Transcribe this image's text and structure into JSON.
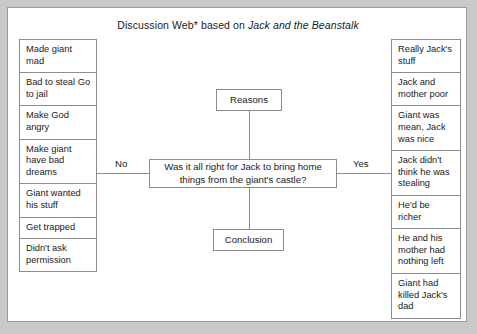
{
  "title": {
    "prefix": "Discussion Web* based on ",
    "book": "Jack and the Beanstalk"
  },
  "center": {
    "reasons_label": "Reasons",
    "question": "Was it all right for Jack to bring home things from the giant's castle?",
    "conclusion_label": "Conclusion"
  },
  "branches": {
    "no_label": "No",
    "yes_label": "Yes"
  },
  "no_reasons": [
    "Made giant mad",
    "Bad to steal Go to jail",
    "Make God angry",
    "Make giant have bad dreams",
    "Giant wanted his stuff",
    "Get trapped",
    "Didn't ask permission"
  ],
  "yes_reasons": [
    "Really Jack's stuff",
    "Jack and mother poor",
    "Giant was mean, Jack was nice",
    "Jack didn't think he was stealing",
    "He'd be richer",
    "He and his mother had nothing left",
    "Giant had killed Jack's dad"
  ],
  "colors": {
    "page_background": "#c9c9c9",
    "canvas_background": "#ffffff",
    "border": "#8d8d8d",
    "text": "#1a1a1a"
  }
}
